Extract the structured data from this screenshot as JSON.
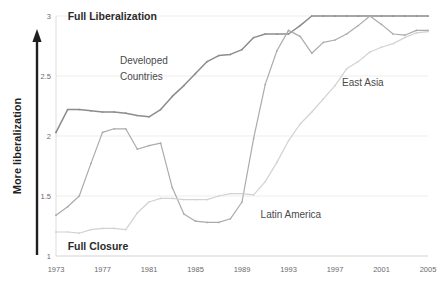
{
  "chart_data": {
    "type": "line",
    "title": "",
    "xlabel": "",
    "ylabel": "More liberalization",
    "xlim": [
      1973,
      2005
    ],
    "ylim": [
      1,
      3
    ],
    "grid": true,
    "legend_position": "inline-annotations",
    "x_ticks": [
      "1973",
      "1977",
      "1981",
      "1985",
      "1989",
      "1993",
      "1997",
      "2001",
      "2005"
    ],
    "y_ticks": [
      "1",
      "1.5",
      "2",
      "2.5",
      "3"
    ],
    "annotations": [
      {
        "text": "Full Liberalization",
        "x": 1974,
        "y": 3.0,
        "style": "bold"
      },
      {
        "text": "Full Closure",
        "x": 1974,
        "y": 1.08,
        "style": "bold"
      },
      {
        "text": "Developed",
        "x": 1978.5,
        "y": 2.63,
        "style": "plain"
      },
      {
        "text": "Countries",
        "x": 1978.5,
        "y": 2.5,
        "style": "plain"
      },
      {
        "text": "Latin America",
        "x": 1990.6,
        "y": 1.35,
        "style": "plain"
      },
      {
        "text": "East Asia",
        "x": 1997.6,
        "y": 2.45,
        "style": "plain"
      }
    ],
    "x": [
      1973,
      1974,
      1975,
      1976,
      1977,
      1978,
      1979,
      1980,
      1981,
      1982,
      1983,
      1984,
      1985,
      1986,
      1987,
      1988,
      1989,
      1990,
      1991,
      1992,
      1993,
      1994,
      1995,
      1996,
      1997,
      1998,
      1999,
      2000,
      2001,
      2002,
      2003,
      2004,
      2005
    ],
    "series": [
      {
        "name": "Developed Countries",
        "color": "#8c8c8c",
        "values": [
          2.03,
          2.22,
          2.22,
          2.21,
          2.2,
          2.2,
          2.19,
          2.17,
          2.16,
          2.22,
          2.33,
          2.42,
          2.52,
          2.62,
          2.67,
          2.68,
          2.72,
          2.82,
          2.85,
          2.85,
          2.85,
          2.92,
          3.0,
          3.0,
          3.0,
          3.0,
          3.0,
          3.0,
          3.0,
          3.0,
          3.0,
          3.0,
          3.0
        ]
      },
      {
        "name": "Latin America",
        "color": "#ababab",
        "values": [
          1.34,
          1.41,
          1.5,
          1.77,
          2.03,
          2.06,
          2.06,
          1.89,
          1.92,
          1.94,
          1.57,
          1.35,
          1.29,
          1.28,
          1.28,
          1.31,
          1.45,
          1.98,
          2.43,
          2.71,
          2.88,
          2.83,
          2.69,
          2.78,
          2.8,
          2.85,
          2.92,
          3.0,
          2.93,
          2.85,
          2.84,
          2.88,
          2.88
        ]
      },
      {
        "name": "East Asia",
        "color": "#d2d2d2",
        "values": [
          1.2,
          1.2,
          1.19,
          1.22,
          1.23,
          1.23,
          1.22,
          1.36,
          1.45,
          1.48,
          1.48,
          1.47,
          1.47,
          1.47,
          1.5,
          1.52,
          1.52,
          1.51,
          1.62,
          1.78,
          1.96,
          2.1,
          2.2,
          2.31,
          2.42,
          2.56,
          2.62,
          2.7,
          2.74,
          2.77,
          2.82,
          2.86,
          2.87
        ]
      }
    ]
  },
  "axis": {
    "y_arrow_label": "More liberalization"
  }
}
